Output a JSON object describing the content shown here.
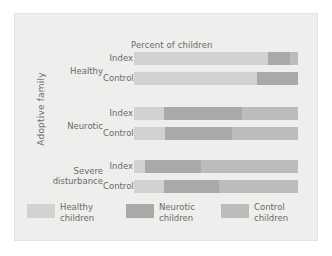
{
  "chart_data": {
    "type": "bar",
    "orientation": "horizontal",
    "stacked": true,
    "title": "Percent of children",
    "xlabel": "Percent of children",
    "ylabel": "Adoptive family",
    "xlim": [
      0,
      100
    ],
    "grid": false,
    "legend_position": "bottom",
    "categories": [
      "Healthy – Index",
      "Healthy – Control",
      "Neurotic – Index",
      "Neurotic – Control",
      "Severe disturbance – Index",
      "Severe disturbance – Control"
    ],
    "series": [
      {
        "name": "Healthy children",
        "color": "#d2d2d0",
        "values": [
          82,
          75,
          18,
          19,
          7,
          18
        ]
      },
      {
        "name": "Neurotic children",
        "color": "#a9a9a7",
        "values": [
          13,
          25,
          48,
          41,
          34,
          34
        ]
      },
      {
        "name": "Control children",
        "color": "#bcbcba",
        "values": [
          5,
          0,
          34,
          40,
          59,
          48
        ]
      }
    ],
    "groups": [
      {
        "name": "Healthy",
        "rows": [
          {
            "label": "Index",
            "segments": [
              82,
              13,
              5
            ]
          },
          {
            "label": "Control",
            "segments": [
              75,
              25,
              0
            ]
          }
        ]
      },
      {
        "name": "Neurotic",
        "rows": [
          {
            "label": "Index",
            "segments": [
              18,
              48,
              34
            ]
          },
          {
            "label": "Control",
            "segments": [
              19,
              41,
              40
            ]
          }
        ]
      },
      {
        "name": "Severe disturbance",
        "rows": [
          {
            "label": "Index",
            "segments": [
              7,
              34,
              59
            ]
          },
          {
            "label": "Control",
            "segments": [
              18,
              34,
              48
            ]
          }
        ]
      }
    ]
  },
  "axis": {
    "y_super_label": "Adoptive family"
  },
  "plot": {
    "title": "Percent of children"
  },
  "groups": {
    "healthy": "Healthy",
    "neurotic": "Neurotic",
    "severe_line1": "Severe",
    "severe_line2": "disturbance"
  },
  "rows": {
    "index": "Index",
    "control": "Control"
  },
  "legend": {
    "items": [
      {
        "line1": "Healthy",
        "line2": "children",
        "color": "#d2d2d0"
      },
      {
        "line1": "Neurotic",
        "line2": "children",
        "color": "#a9a9a7"
      },
      {
        "line1": "Control",
        "line2": "children",
        "color": "#bcbcba"
      }
    ]
  },
  "colors": {
    "background": "#ffffff",
    "panel": "#eeeeec",
    "panel_border": "#e4e4e2",
    "text": "#6a6a68",
    "healthy": "#d2d2d0",
    "neurotic": "#a9a9a7",
    "control": "#bcbcba"
  }
}
